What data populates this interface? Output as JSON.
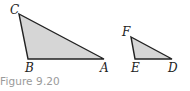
{
  "figure": {
    "caption": "Figure 9.20",
    "fill_color": "#d6d6d6",
    "stroke_color": "#222222",
    "triangles": [
      {
        "name": "triangle-CBA",
        "points": "19,14 28,59 104,59",
        "labels": [
          {
            "text": "C",
            "x": 10,
            "y": 14
          },
          {
            "text": "B",
            "x": 25,
            "y": 72
          },
          {
            "text": "A",
            "x": 100,
            "y": 72
          }
        ]
      },
      {
        "name": "triangle-FED",
        "points": "131,37 135,59 172,59",
        "labels": [
          {
            "text": "F",
            "x": 122,
            "y": 36
          },
          {
            "text": "E",
            "x": 131,
            "y": 72
          },
          {
            "text": "D",
            "x": 168,
            "y": 72
          }
        ]
      }
    ]
  }
}
